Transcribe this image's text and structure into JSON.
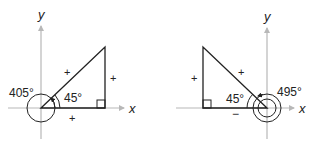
{
  "colors": {
    "axis": "#b8b8b8",
    "line": "#222222",
    "text": "#222222"
  },
  "diagrams": [
    {
      "name": "angle-405",
      "axis_labels": {
        "x": "x",
        "y": "y"
      },
      "coterminal_angle": "405°",
      "reference_angle": "45°",
      "signs": {
        "hypotenuse": "+",
        "opposite": "+",
        "adjacent": "+"
      }
    },
    {
      "name": "angle-495",
      "axis_labels": {
        "x": "x",
        "y": "y"
      },
      "coterminal_angle": "495°",
      "reference_angle": "45°",
      "signs": {
        "hypotenuse": "+",
        "opposite": "+",
        "adjacent": "−"
      }
    }
  ]
}
